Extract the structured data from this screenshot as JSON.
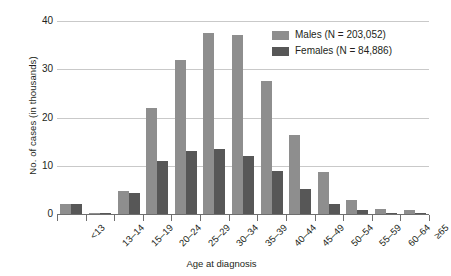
{
  "chart_data": {
    "type": "bar",
    "title": "",
    "xlabel": "Age at diagnosis",
    "ylabel": "No. of cases (in thousands)",
    "ylim": [
      0,
      40
    ],
    "yticks": [
      0,
      10,
      20,
      30,
      40
    ],
    "grid": true,
    "legend_position": "top-right",
    "categories": [
      "<13",
      "13–14",
      "15–19",
      "20–24",
      "25–29",
      "30–34",
      "35–39",
      "40–44",
      "45–49",
      "50–54",
      "55–59",
      "60–64",
      "≥65"
    ],
    "series": [
      {
        "name": "Males (N = 203,052)",
        "short_name": "Males",
        "color": "#8e8e8e",
        "values": [
          2.0,
          0.2,
          4.7,
          22.0,
          32.0,
          37.5,
          37.0,
          27.5,
          16.3,
          8.7,
          3.0,
          1.0,
          0.9
        ]
      },
      {
        "name": "Females (N = 84,886)",
        "short_name": "Females",
        "color": "#575757",
        "values": [
          2.0,
          0.2,
          4.3,
          11.0,
          13.0,
          13.5,
          12.0,
          9.0,
          5.2,
          2.0,
          0.8,
          0.3,
          0.3
        ]
      }
    ]
  },
  "axis": {
    "ytick_labels": [
      "40",
      "30",
      "20",
      "10",
      "0"
    ],
    "y_title": "No. of cases (in thousands)",
    "x_title": "Age at diagnosis"
  },
  "legend": {
    "items": [
      {
        "label": "Males (N = 203,052)",
        "color": "#8e8e8e"
      },
      {
        "label": "Females (N = 84,886)",
        "color": "#575757"
      }
    ]
  },
  "colors": {
    "males": "#8e8e8e",
    "females": "#575757",
    "gridline": "#c9c9c9",
    "axis": "#6f6f6f",
    "text": "#231f20",
    "background": "#ffffff"
  }
}
